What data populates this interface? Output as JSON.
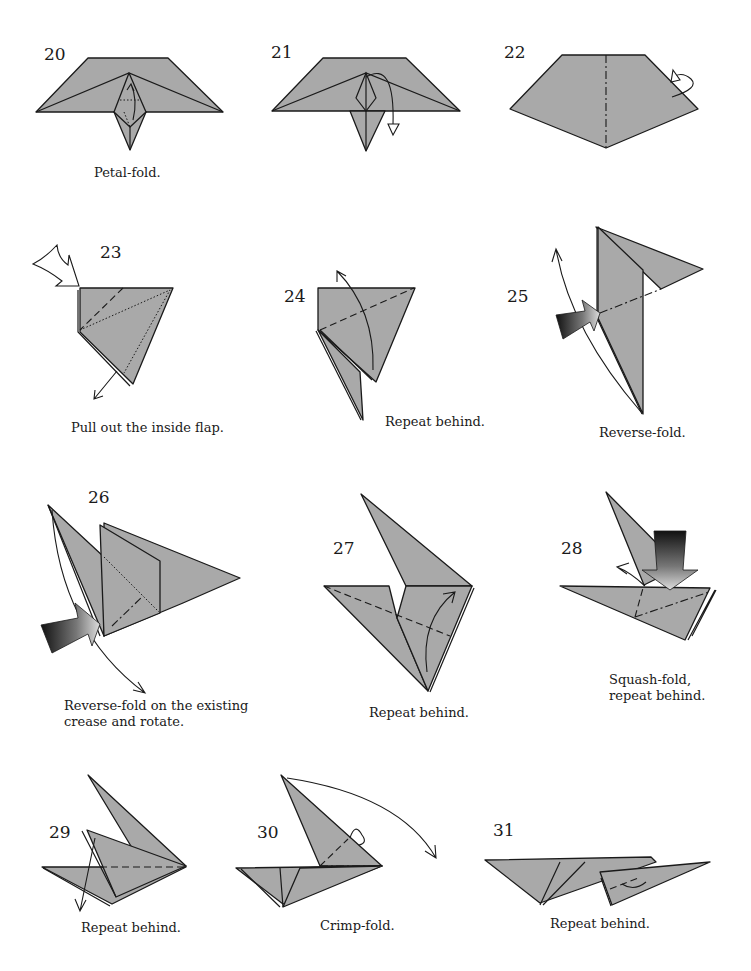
{
  "page": {
    "paper_color": "#a9a9a9",
    "line_color": "#1a1a1a"
  },
  "steps": [
    {
      "number": "20",
      "caption": "Petal-fold."
    },
    {
      "number": "21",
      "caption": ""
    },
    {
      "number": "22",
      "caption": ""
    },
    {
      "number": "23",
      "caption": "Pull out the inside flap."
    },
    {
      "number": "24",
      "caption": "Repeat behind."
    },
    {
      "number": "25",
      "caption": "Reverse-fold."
    },
    {
      "number": "26",
      "caption_line1": "Reverse-fold on the existing",
      "caption_line2": "crease and rotate."
    },
    {
      "number": "27",
      "caption": "Repeat behind."
    },
    {
      "number": "28",
      "caption_line1": "Squash-fold,",
      "caption_line2": "repeat behind."
    },
    {
      "number": "29",
      "caption": "Repeat behind."
    },
    {
      "number": "30",
      "caption": "Crimp-fold."
    },
    {
      "number": "31",
      "caption": "Repeat behind."
    }
  ],
  "icons": {
    "fold_arrow": "fold-arrow-icon",
    "turn_over": "turn-over-icon",
    "push_arrow": "push-arrow-icon",
    "pull_arrow": "pull-arrow-icon"
  }
}
